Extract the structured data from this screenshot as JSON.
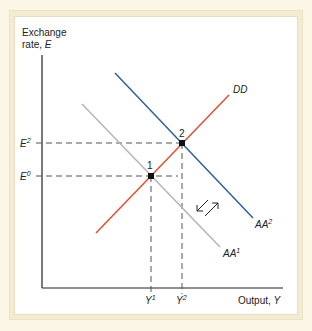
{
  "diagram": {
    "y_axis_label_line1": "Exchange",
    "y_axis_label_line2": "rate, ",
    "y_axis_var": "E",
    "x_axis_label": "Output, ",
    "x_axis_var": "Y",
    "e_ticks": [
      {
        "base": "E",
        "sup": "2"
      },
      {
        "base": "E",
        "sup": "0"
      }
    ],
    "y_ticks": [
      {
        "base": "Y",
        "sup": "1"
      },
      {
        "base": "Y",
        "sup": "2"
      }
    ],
    "curves": [
      {
        "name": "DD",
        "color": "#e0502e"
      },
      {
        "name": "AA",
        "sup": "2",
        "color": "#2f5f9e"
      },
      {
        "name": "AA",
        "sup": "1",
        "color": "#b5b5b5"
      }
    ],
    "points": [
      {
        "label": "1"
      },
      {
        "label": "2"
      }
    ],
    "colors": {
      "background": "#fbf6e6",
      "frame": "#f3ecd3",
      "panel": "#ffffff",
      "axis": "#222222",
      "dashed": "#555555"
    }
  }
}
